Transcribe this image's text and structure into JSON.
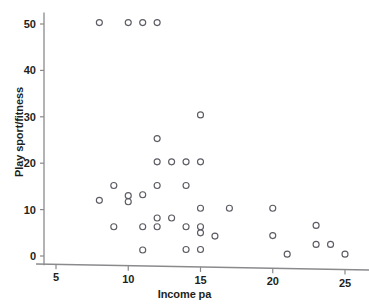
{
  "chart_data": {
    "type": "scatter",
    "title": "",
    "xlabel": "Income pa",
    "ylabel": "Play sport/fitness",
    "xlim": [
      3.6,
      26.2
    ],
    "ylim": [
      -2.0,
      52.5
    ],
    "xticks": [
      5,
      10,
      15,
      20,
      25
    ],
    "xticklabels": [
      "5",
      "10",
      "15",
      "20",
      "25"
    ],
    "yticks": [
      0,
      10,
      20,
      30,
      40,
      50
    ],
    "yticklabels": [
      "0",
      "10",
      "20",
      "30",
      "40",
      "50"
    ],
    "grid": false,
    "legend": null,
    "marker": "open-circle",
    "marker_color": "#5b5b63",
    "axis_color": "#8a8a8d",
    "n_points": 41,
    "points": [
      {
        "x": 8,
        "y": 50.3
      },
      {
        "x": 10,
        "y": 50.3
      },
      {
        "x": 11,
        "y": 50.3
      },
      {
        "x": 12,
        "y": 50.3
      },
      {
        "x": 15,
        "y": 30.4
      },
      {
        "x": 12,
        "y": 25.3
      },
      {
        "x": 12,
        "y": 20.3
      },
      {
        "x": 13,
        "y": 20.3
      },
      {
        "x": 14,
        "y": 20.3
      },
      {
        "x": 15,
        "y": 20.3
      },
      {
        "x": 9,
        "y": 15.2
      },
      {
        "x": 12,
        "y": 15.2
      },
      {
        "x": 14,
        "y": 15.2
      },
      {
        "x": 10,
        "y": 13.0
      },
      {
        "x": 11,
        "y": 13.2
      },
      {
        "x": 10,
        "y": 11.7
      },
      {
        "x": 8,
        "y": 12.0
      },
      {
        "x": 15,
        "y": 10.3
      },
      {
        "x": 17,
        "y": 10.3
      },
      {
        "x": 20,
        "y": 10.3
      },
      {
        "x": 12,
        "y": 8.2
      },
      {
        "x": 13,
        "y": 8.2
      },
      {
        "x": 23,
        "y": 6.6
      },
      {
        "x": 9,
        "y": 6.3
      },
      {
        "x": 11,
        "y": 6.3
      },
      {
        "x": 12,
        "y": 6.3
      },
      {
        "x": 14,
        "y": 6.3
      },
      {
        "x": 15,
        "y": 6.3
      },
      {
        "x": 15,
        "y": 5.0
      },
      {
        "x": 16,
        "y": 4.3
      },
      {
        "x": 20,
        "y": 4.4
      },
      {
        "x": 23,
        "y": 2.5
      },
      {
        "x": 24,
        "y": 2.5
      },
      {
        "x": 11,
        "y": 1.3
      },
      {
        "x": 14,
        "y": 1.4
      },
      {
        "x": 15,
        "y": 1.4
      },
      {
        "x": 21,
        "y": 0.4
      },
      {
        "x": 25,
        "y": 0.4
      }
    ]
  },
  "axes": {
    "x_label": "Income pa",
    "y_label": "Play sport/fitness"
  }
}
